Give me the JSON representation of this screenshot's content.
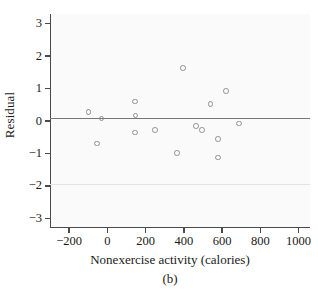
{
  "figure": {
    "caption": "(b)",
    "background": "#ffffff",
    "panel_background": "#fafafa",
    "axis_color": "#4a4a4a",
    "marker_color": "#8f8f96",
    "zero_line_color": "#777777",
    "reference_line_color": "#e3e3e3"
  },
  "chart_data": {
    "type": "scatter",
    "title": "",
    "subtitle": "",
    "xlabel": "Nonexercise activity (calories)",
    "ylabel": "Residual",
    "xlim": [
      -300,
      1060
    ],
    "ylim": [
      -3.3,
      3.3
    ],
    "xticks": [
      -200,
      0,
      200,
      400,
      600,
      800,
      1000
    ],
    "xtick_labels": [
      "−200",
      "0",
      "200",
      "400",
      "600",
      "800",
      "1000"
    ],
    "yticks": [
      3,
      2,
      1,
      0,
      -1,
      -2,
      -3
    ],
    "ytick_labels": [
      "3",
      "2",
      "1",
      "0",
      "−1",
      "−2",
      "−3"
    ],
    "grid": false,
    "legend": null,
    "reference_lines": [
      {
        "axis": "y",
        "value": 0,
        "style": "solid",
        "color": "#777777",
        "weight": "medium"
      },
      {
        "axis": "y",
        "value": -2,
        "style": "solid",
        "color": "#e3e3e3",
        "weight": "faint"
      }
    ],
    "marker": {
      "shape": "circle",
      "filled": false,
      "size": 5.6
    },
    "points": [
      {
        "x": -99,
        "y": 0.27
      },
      {
        "x": -30,
        "y": 0.08
      },
      {
        "x": -55,
        "y": -0.7
      },
      {
        "x": 145,
        "y": 0.6
      },
      {
        "x": 148,
        "y": 0.17
      },
      {
        "x": 145,
        "y": -0.35
      },
      {
        "x": 250,
        "y": -0.28
      },
      {
        "x": 365,
        "y": -0.98
      },
      {
        "x": 395,
        "y": 1.63
      },
      {
        "x": 465,
        "y": -0.15
      },
      {
        "x": 495,
        "y": -0.28
      },
      {
        "x": 540,
        "y": 0.52
      },
      {
        "x": 578,
        "y": -0.55
      },
      {
        "x": 580,
        "y": -1.12
      },
      {
        "x": 620,
        "y": 0.92
      },
      {
        "x": 690,
        "y": -0.08
      }
    ]
  }
}
